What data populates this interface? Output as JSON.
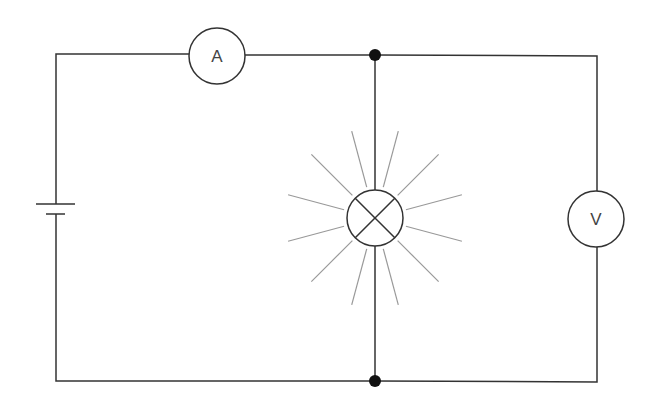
{
  "diagram": {
    "type": "circuit-schematic",
    "colors": {
      "wire": "#333333",
      "ray": "#999999",
      "junction": "#111111",
      "background": "#ffffff"
    },
    "components": {
      "ammeter": {
        "label": "A",
        "cx": 217,
        "cy": 56,
        "r": 28
      },
      "voltmeter": {
        "label": "V",
        "cx": 596,
        "cy": 219,
        "r": 28
      },
      "lamp": {
        "cx": 375,
        "cy": 218,
        "r": 28,
        "state": "lit",
        "rays": 16
      },
      "battery": {
        "x": 56,
        "long_plate_y": 204,
        "short_plate_y": 214
      },
      "junctions": [
        {
          "x": 375,
          "y": 55
        },
        {
          "x": 375,
          "y": 381
        }
      ]
    }
  }
}
